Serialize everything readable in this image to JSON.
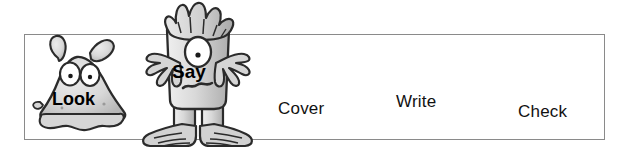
{
  "worksheet": {
    "title": "Look Say Cover Write Check",
    "background_color": "#ffffff",
    "border_color": "#8a8a8a",
    "text_color": "#111111"
  },
  "strip": {
    "name": "spelling-strip",
    "steps": [
      {
        "id": "look",
        "label": "Look",
        "style": "bold-on-character"
      },
      {
        "id": "say",
        "label": "Say",
        "style": "bold-on-character"
      },
      {
        "id": "cover",
        "label": "Cover",
        "style": "plain"
      },
      {
        "id": "write",
        "label": "Write",
        "style": "plain"
      },
      {
        "id": "check",
        "label": "Check",
        "style": "plain"
      }
    ]
  },
  "characters": [
    {
      "id": "look-blob-monster",
      "caption": "Look",
      "description": "grey blob monster with two antennae and two eyes",
      "fill": "#d2d2d2",
      "outline": "#2b2b2b"
    },
    {
      "id": "say-cyclops-monster",
      "caption": "Say",
      "description": "tall grey one-eyed monster with spiky hair, outstretched arms and large feet",
      "fill": "#c9c9c9",
      "outline": "#2b2b2b"
    }
  ]
}
